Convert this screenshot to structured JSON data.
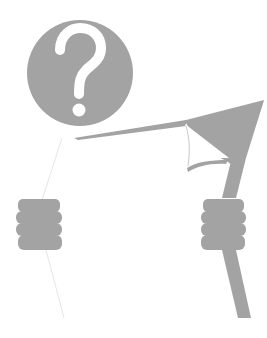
{
  "illustration": {
    "title": "",
    "subject": "figure-with-question-mark-head-holding-sign",
    "head_glyph": "?",
    "colors": {
      "figure_gray": "#a3a3a3",
      "outline_gray": "#e4e4e4",
      "background": "#ffffff",
      "glyph": "#ffffff"
    }
  }
}
